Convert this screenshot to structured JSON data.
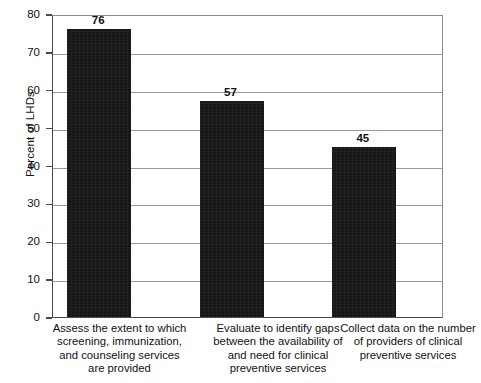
{
  "chart_data": {
    "type": "bar",
    "title": "",
    "xlabel": "",
    "ylabel": "Percent of LHDs",
    "ylim": [
      0,
      80
    ],
    "ytick_step": 10,
    "ytick_labels": [
      "80",
      "70",
      "60",
      "50",
      "40",
      "30",
      "20",
      "10",
      "0"
    ],
    "grid": true,
    "legend": "none",
    "bar_color": "#171717",
    "categories": [
      "Assess the extent to which screening, immunization, and counseling services are provided",
      "Evaluate to identify gaps between the availability of and need for clinical preventive services",
      "Collect data on the number of providers of clinical preventive services"
    ],
    "category_lines": [
      [
        "Assess the extent to which",
        "screening, immunization,",
        "and counseling services",
        "are provided"
      ],
      [
        "Evaluate to identify gaps",
        "between the availability of",
        "and need for clinical",
        "preventive services"
      ],
      [
        "Collect data on the number",
        "of providers of clinical",
        "preventive services"
      ]
    ],
    "values": [
      76,
      57,
      45
    ],
    "value_labels": [
      "76",
      "57",
      "45"
    ]
  }
}
